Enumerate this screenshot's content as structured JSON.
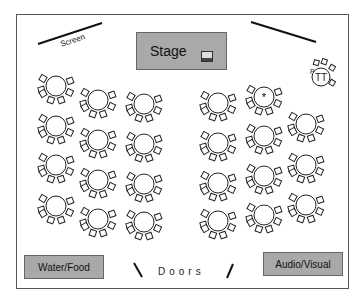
{
  "diagram": {
    "type": "banquet-floor-plan",
    "labels": {
      "screen": "Screen",
      "stage": "Stage",
      "doors": "Doors",
      "water_food": "Water/Food",
      "audio_visual": "Audio/Visual"
    },
    "special_tables": {
      "head_table_marker": "*",
      "tt_table_label": "TT",
      "tt_table_side_label": "P"
    },
    "colors": {
      "station_fill": "#a9a9a9",
      "line": "#222222",
      "border": "#555555"
    },
    "tables": [
      {
        "col": 1,
        "x": 56,
        "y": 86
      },
      {
        "col": 1,
        "x": 56,
        "y": 126
      },
      {
        "col": 1,
        "x": 56,
        "y": 165
      },
      {
        "col": 1,
        "x": 56,
        "y": 206
      },
      {
        "col": 2,
        "x": 98,
        "y": 100
      },
      {
        "col": 2,
        "x": 98,
        "y": 140
      },
      {
        "col": 2,
        "x": 98,
        "y": 180
      },
      {
        "col": 2,
        "x": 98,
        "y": 219
      },
      {
        "col": 3,
        "x": 144,
        "y": 104
      },
      {
        "col": 3,
        "x": 144,
        "y": 144
      },
      {
        "col": 3,
        "x": 144,
        "y": 184
      },
      {
        "col": 3,
        "x": 144,
        "y": 222
      },
      {
        "col": 4,
        "x": 218,
        "y": 103
      },
      {
        "col": 4,
        "x": 218,
        "y": 143
      },
      {
        "col": 4,
        "x": 218,
        "y": 183
      },
      {
        "col": 4,
        "x": 218,
        "y": 221
      },
      {
        "col": 5,
        "x": 264,
        "y": 97,
        "mark": "*"
      },
      {
        "col": 5,
        "x": 264,
        "y": 136
      },
      {
        "col": 5,
        "x": 264,
        "y": 176
      },
      {
        "col": 5,
        "x": 264,
        "y": 215
      },
      {
        "col": 6,
        "x": 306,
        "y": 124
      },
      {
        "col": 6,
        "x": 306,
        "y": 165
      },
      {
        "col": 6,
        "x": 306,
        "y": 205
      }
    ],
    "table_count": 23
  }
}
